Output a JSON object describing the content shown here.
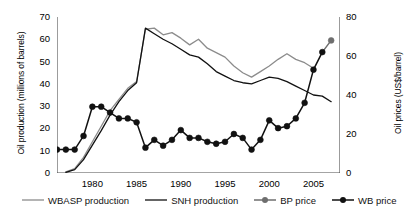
{
  "axes": {
    "y_left_title": "Oil production (millions of barrels)",
    "y_right_title": "Oil prices (US$/barrel)",
    "y_left_ticks": [
      "0",
      "10",
      "20",
      "30",
      "40",
      "50",
      "60",
      "70"
    ],
    "y_right_ticks": [
      "0",
      "20",
      "40",
      "60",
      "80"
    ],
    "x_ticks": [
      "1980",
      "1985",
      "1990",
      "1995",
      "2000",
      "2005"
    ]
  },
  "legend": {
    "items": [
      {
        "label": "WBASP production",
        "marker": "line",
        "color": "#8c8c8c"
      },
      {
        "label": "SNH production",
        "marker": "line",
        "color": "#111111"
      },
      {
        "label": "BP price",
        "marker": "line-dot",
        "color": "#6e6e6e"
      },
      {
        "label": "WB price",
        "marker": "line-dot",
        "color": "#111111"
      }
    ]
  },
  "colors": {
    "wbasp": "#8c8c8c",
    "snh": "#111111",
    "bp": "#6e6e6e",
    "wb": "#111111",
    "axis": "#4a4a4a"
  },
  "chart_data": {
    "type": "line",
    "title": "",
    "xlabel": "",
    "ylabel": "Oil production (millions of barrels)",
    "y2label": "Oil prices (US$/barrel)",
    "xlim": [
      1976,
      2008
    ],
    "ylim": [
      0,
      70
    ],
    "y2lim": [
      0,
      80
    ],
    "grid": false,
    "legend_position": "bottom",
    "series": [
      {
        "name": "WBASP production",
        "axis": "left",
        "color": "#8c8c8c",
        "marker": "none",
        "x": [
          1977,
          1978,
          1979,
          1980,
          1981,
          1982,
          1983,
          1984,
          1985,
          1986,
          1987,
          1988,
          1989,
          1990,
          1991,
          1992,
          1993,
          1994,
          1995,
          1996,
          1997,
          1998,
          1999,
          2000,
          2001,
          2002,
          2003,
          2004,
          2005
        ],
        "y": [
          0.5,
          2,
          7,
          14,
          21,
          28,
          33,
          38,
          41,
          64.5,
          65,
          62,
          63,
          60.5,
          57.5,
          60,
          56,
          54,
          52,
          48,
          45,
          43,
          45.5,
          48,
          51,
          53.5,
          51,
          49.5,
          47
        ]
      },
      {
        "name": "SNH production",
        "axis": "left",
        "color": "#111111",
        "marker": "none",
        "x": [
          1977,
          1978,
          1979,
          1980,
          1981,
          1982,
          1983,
          1984,
          1985,
          1986,
          1987,
          1988,
          1989,
          1990,
          1991,
          1992,
          1993,
          1994,
          1995,
          1996,
          1997,
          1998,
          1999,
          2000,
          2001,
          2002,
          2003,
          2004,
          2005,
          2006,
          2007
        ],
        "y": [
          0.3,
          1.5,
          6,
          12.5,
          19,
          26,
          32,
          37,
          40.5,
          65,
          62.5,
          60,
          58,
          55.5,
          53,
          52,
          49,
          45.5,
          43.5,
          41.5,
          40.5,
          40,
          41.5,
          43,
          42.5,
          41,
          39,
          37,
          35,
          34.5,
          32
        ]
      },
      {
        "name": "BP price",
        "axis": "right",
        "color": "#6e6e6e",
        "marker": "circle",
        "x": [
          2007
        ],
        "y": [
          68
        ]
      },
      {
        "name": "WB price",
        "axis": "right",
        "color": "#111111",
        "marker": "circle",
        "x": [
          1976,
          1977,
          1978,
          1979,
          1980,
          1981,
          1982,
          1983,
          1984,
          1985,
          1986,
          1987,
          1988,
          1989,
          1990,
          1991,
          1992,
          1993,
          1994,
          1995,
          1996,
          1997,
          1998,
          1999,
          2000,
          2001,
          2002,
          2003,
          2004,
          2005,
          2006
        ],
        "y": [
          12,
          12,
          12,
          19,
          34,
          34,
          31,
          28,
          28,
          26,
          13,
          17,
          14,
          17,
          22,
          18,
          18,
          16,
          15,
          16,
          20,
          18,
          12,
          17,
          27,
          23,
          24,
          28,
          36,
          53,
          62
        ]
      }
    ]
  }
}
